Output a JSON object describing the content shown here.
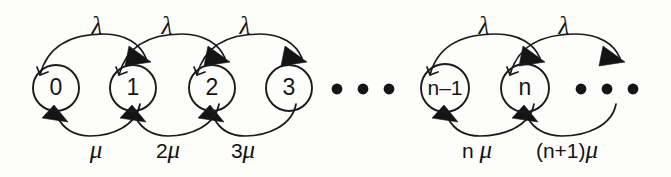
{
  "diagram": {
    "background_color": "#fdfdfb",
    "ink_color": "#1a1a1a",
    "states": [
      {
        "id": "s0",
        "label": "0",
        "cx": 56,
        "cy": 88,
        "r": 23
      },
      {
        "id": "s1",
        "label": "1",
        "cx": 133,
        "cy": 88,
        "r": 23
      },
      {
        "id": "s2",
        "label": "2",
        "cx": 212,
        "cy": 88,
        "r": 23
      },
      {
        "id": "s3",
        "label": "3",
        "cx": 289,
        "cy": 88,
        "r": 23
      },
      {
        "id": "sn1",
        "label": "n–1",
        "cx": 445,
        "cy": 88,
        "r": 24
      },
      {
        "id": "sn",
        "label": "n",
        "cx": 525,
        "cy": 88,
        "r": 24
      }
    ],
    "birth_labels": [
      {
        "text": "λ",
        "x": 97,
        "y": 28
      },
      {
        "text": "λ",
        "x": 167,
        "y": 28
      },
      {
        "text": "λ",
        "x": 245,
        "y": 28
      },
      {
        "text": "λ",
        "x": 484,
        "y": 28
      },
      {
        "text": "λ",
        "x": 564,
        "y": 28
      }
    ],
    "death_labels": [
      {
        "coef": "",
        "mu": "μ",
        "x": 96,
        "y": 152
      },
      {
        "coef": "2",
        "mu": "μ",
        "x": 168,
        "y": 152
      },
      {
        "coef": "3",
        "mu": "μ",
        "x": 243,
        "y": 152
      },
      {
        "coef": "n ",
        "mu": "μ",
        "x": 477,
        "y": 152
      },
      {
        "coef": "(n+1)",
        "mu": "μ",
        "x": 567,
        "y": 152
      }
    ],
    "ellipses": [
      {
        "id": "middle-ellipsis",
        "dots": [
          {
            "cx": 337,
            "cy": 89
          },
          {
            "cx": 363,
            "cy": 89
          },
          {
            "cx": 389,
            "cy": 89
          }
        ],
        "r": 5.4
      },
      {
        "id": "right-ellipsis",
        "dots": [
          {
            "cx": 581,
            "cy": 89
          },
          {
            "cx": 607,
            "cy": 89
          },
          {
            "cx": 633,
            "cy": 89
          }
        ],
        "r": 5.4
      }
    ],
    "birth_arcs": [
      {
        "from": "s0",
        "to": "s1",
        "d": "M 41 74 C 52 42, 118 38, 134 62"
      },
      {
        "from": "s1",
        "to": "s2",
        "d": "M 119 74 C 130 42, 197 38, 213 62"
      },
      {
        "from": "s2",
        "to": "s3",
        "d": "M 197 74 C 208 42, 274 38, 290 62"
      },
      {
        "from": "sn1",
        "to": "sn",
        "d": "M 430 74 C 441 42, 510 38, 526 62"
      },
      {
        "from": "sn",
        "to": "next",
        "d": "M 510 74 C 521 42, 590 38, 606 62"
      }
    ],
    "death_arcs": [
      {
        "from": "s1",
        "to": "s0",
        "d": "M 133 111 C 122 136, 72 136, 58 113"
      },
      {
        "from": "s2",
        "to": "s1",
        "d": "M 212 111 C 201 136, 150 136, 136 113"
      },
      {
        "from": "s3",
        "to": "s2",
        "d": "M 289 111 C 278 136, 228 136, 214 113"
      },
      {
        "from": "sn",
        "to": "sn1",
        "d": "M 525 111 C 514 136, 462 136, 448 113"
      },
      {
        "from": "next",
        "to": "sn",
        "d": "M 606 111 C 595 136, 542 136, 528 113"
      }
    ],
    "birth_arrowheads": [
      {
        "points": "131,48 145,66 120,67",
        "rotate": -12,
        "cx": 132,
        "cy": 60
      },
      {
        "points": "210,48 224,66 199,67",
        "rotate": -12,
        "cx": 211,
        "cy": 60
      },
      {
        "points": "287,48 301,66 276,67",
        "rotate": -12,
        "cx": 288,
        "cy": 60
      },
      {
        "points": "523,48 537,66 512,67",
        "rotate": -12,
        "cx": 524,
        "cy": 60
      },
      {
        "points": "603,48 617,66 592,67",
        "rotate": -12,
        "cx": 604,
        "cy": 60
      }
    ],
    "death_arrowheads": [
      {
        "cx": 60,
        "cy": 115
      },
      {
        "cx": 138,
        "cy": 115
      },
      {
        "cx": 216,
        "cy": 115
      },
      {
        "cx": 450,
        "cy": 115
      },
      {
        "cx": 530,
        "cy": 115
      }
    ],
    "arc_tail_ticks": [
      {
        "d": "M 41 74 L 37 69"
      },
      {
        "d": "M 41 74 L 46 70"
      },
      {
        "d": "M 119 74 L 115 69"
      },
      {
        "d": "M 197 74 L 193 69"
      },
      {
        "d": "M 430 74 L 426 69"
      },
      {
        "d": "M 510 74 L 506 69"
      }
    ]
  }
}
